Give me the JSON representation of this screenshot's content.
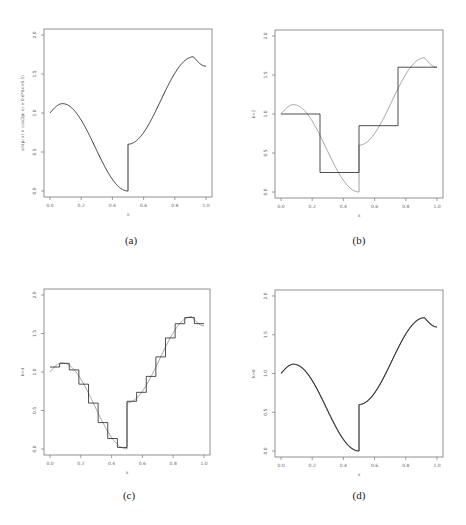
{
  "figure": {
    "captions": [
      "(a)",
      "(b)",
      "(c)",
      "(d)"
    ]
  },
  "chart_data": [
    {
      "type": "line",
      "panel": "(a)",
      "title": "",
      "xlabel": "x",
      "ylabel": "sin(pi x) + cos(2pi x) + 0.6*I(x>0.5)",
      "xlim": [
        0,
        1
      ],
      "ylim": [
        0,
        2
      ],
      "xticks": [
        "0.0",
        "0.2",
        "0.4",
        "0.6",
        "0.8",
        "1.0"
      ],
      "yticks": [
        "0.0",
        "0.5",
        "1.0",
        "1.5",
        "2.0"
      ],
      "grid": false,
      "series": [
        {
          "name": "true function",
          "x": [
            0.0,
            0.08,
            0.2,
            0.3,
            0.4,
            0.5,
            0.5,
            0.6,
            0.7,
            0.8,
            0.92,
            1.0
          ],
          "values": [
            1.0,
            1.12,
            0.9,
            0.5,
            0.15,
            0.0,
            0.6,
            0.75,
            1.1,
            1.45,
            1.72,
            1.6
          ]
        }
      ]
    },
    {
      "type": "line",
      "panel": "(b)",
      "xlabel": "x",
      "ylabel": "k=2",
      "xlim": [
        0,
        1
      ],
      "ylim": [
        0,
        2
      ],
      "xticks": [
        "0.0",
        "0.2",
        "0.4",
        "0.6",
        "0.8",
        "1.0"
      ],
      "yticks": [
        "0.0",
        "0.5",
        "1.0",
        "1.5",
        "2.0"
      ],
      "grid": false,
      "series": [
        {
          "name": "true function",
          "style": "gray"
        },
        {
          "name": "step approximation",
          "bins": [
            0,
            0.25,
            0.5,
            0.75,
            1.0
          ],
          "values": [
            1.0,
            0.25,
            0.85,
            1.6
          ]
        }
      ]
    },
    {
      "type": "line",
      "panel": "(c)",
      "xlabel": "x",
      "ylabel": "k=4",
      "xlim": [
        0,
        1
      ],
      "ylim": [
        0,
        2
      ],
      "xticks": [
        "0.0",
        "0.2",
        "0.4",
        "0.6",
        "0.8",
        "1.0"
      ],
      "yticks": [
        "0.0",
        "0.5",
        "1.0",
        "1.5",
        "2.0"
      ],
      "grid": false,
      "series": [
        {
          "name": "true function",
          "style": "gray"
        },
        {
          "name": "step approximation",
          "n_bins": 16
        }
      ]
    },
    {
      "type": "line",
      "panel": "(d)",
      "xlabel": "x",
      "ylabel": "k=8",
      "xlim": [
        0,
        1
      ],
      "ylim": [
        0,
        2
      ],
      "xticks": [
        "0.0",
        "0.2",
        "0.4",
        "0.6",
        "0.8",
        "1.0"
      ],
      "yticks": [
        "0.0",
        "0.5",
        "1.0",
        "1.5",
        "2.0"
      ],
      "grid": false,
      "series": [
        {
          "name": "true function",
          "style": "gray"
        },
        {
          "name": "step approximation",
          "n_bins": 256
        }
      ]
    }
  ]
}
